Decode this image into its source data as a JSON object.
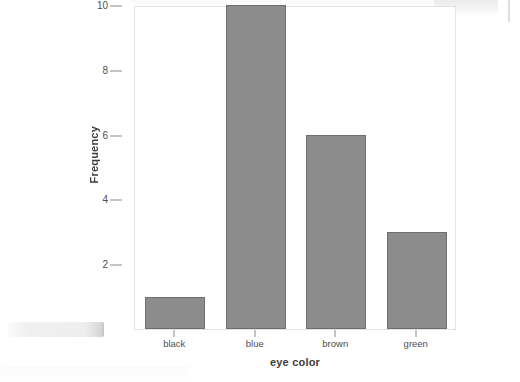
{
  "chart_data": {
    "type": "bar",
    "title": "",
    "subtitle": "",
    "xlabel": "eye color",
    "ylabel": "Frequency",
    "categories": [
      "black",
      "blue",
      "brown",
      "green"
    ],
    "values": [
      1,
      10,
      6,
      3
    ],
    "series": [
      {
        "name": "Frequency",
        "values": [
          1,
          10,
          6,
          3
        ]
      }
    ],
    "ylim": [
      0,
      10
    ],
    "y_ticks": [
      2,
      4,
      6,
      8,
      10
    ],
    "y_tick_labels": [
      "2",
      "4",
      "6",
      "8",
      "10"
    ],
    "x_tick_labels": [
      "black",
      "blue",
      "brown",
      "green"
    ],
    "grid": false,
    "legend": false,
    "legend_position": "none",
    "bar_fill_color": "#8c8c8c",
    "bar_border_color": "#6e6e6e",
    "panel_background_color": "#ffffff",
    "panel_border_color": "#e2e2e2",
    "axis_text_color": "#4d4d4d",
    "axis_title_color": "#3d3d3d"
  },
  "artifacts": {
    "bottom_left_smudge": "scan-smudge",
    "top_right_smudge": "scan-smudge",
    "right_streak": "scan-streak"
  }
}
